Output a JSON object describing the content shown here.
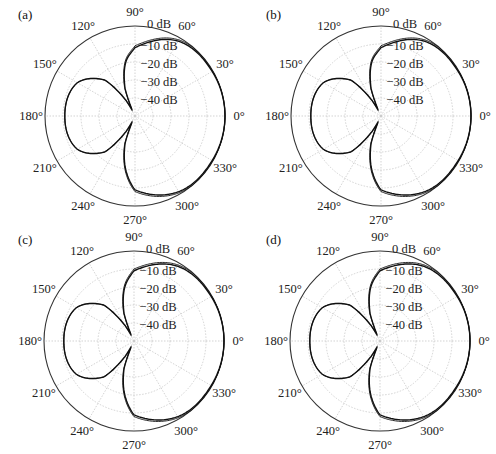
{
  "panels": [
    {
      "label": "(a)",
      "left": 0,
      "top": 0,
      "cx": 135,
      "cy": 116,
      "R": 90
    },
    {
      "label": "(b)",
      "left": 248,
      "top": 0,
      "cx": 133,
      "cy": 116,
      "R": 90
    },
    {
      "label": "(c)",
      "left": 0,
      "top": 225,
      "cx": 134,
      "cy": 116,
      "R": 90
    },
    {
      "label": "(d)",
      "left": 248,
      "top": 225,
      "cx": 132,
      "cy": 116,
      "R": 90
    }
  ],
  "chart_data": [
    {
      "type": "polar-line",
      "title": "(a)",
      "angle_ticks": [
        "0°",
        "30°",
        "60°",
        "90°",
        "120°",
        "150°",
        "180°",
        "210°",
        "240°",
        "270°",
        "300°",
        "330°"
      ],
      "radial_ticks": [
        "0 dB",
        "−10 dB",
        "−20 dB",
        "−30 dB",
        "−40 dB"
      ],
      "r_range_db": [
        -50,
        0
      ],
      "grid": true,
      "series": [
        {
          "name": "pattern",
          "theta_deg": [
            0,
            30,
            60,
            90,
            100,
            110,
            115,
            120,
            130,
            150,
            180,
            210,
            230,
            240,
            245,
            250,
            260,
            270,
            300,
            330,
            360
          ],
          "db": [
            0,
            -0.5,
            -2,
            -12,
            -20,
            -34,
            -46,
            -40,
            -24,
            -13,
            -11,
            -13,
            -24,
            -40,
            -46,
            -34,
            -20,
            -9,
            -1.5,
            -0.5,
            0
          ]
        },
        {
          "name": "reference",
          "theta_deg": [
            0,
            30,
            60,
            90,
            100,
            110,
            115,
            120,
            130,
            150,
            180,
            210,
            230,
            240,
            245,
            250,
            260,
            270,
            300,
            330,
            360
          ],
          "db": [
            0,
            -0.2,
            -1.2,
            -11,
            -19,
            -33,
            -45,
            -40,
            -24,
            -13,
            -11,
            -13,
            -24,
            -40,
            -45,
            -33,
            -19,
            -8,
            -0.8,
            -0.2,
            0
          ]
        }
      ]
    },
    {
      "type": "polar-line",
      "title": "(b)",
      "angle_ticks": [
        "0°",
        "30°",
        "60°",
        "90°",
        "120°",
        "150°",
        "180°",
        "210°",
        "240°",
        "270°",
        "300°",
        "330°"
      ],
      "radial_ticks": [
        "0 dB",
        "−10 dB",
        "−20 dB",
        "−30 dB",
        "−40 dB"
      ],
      "r_range_db": [
        -50,
        0
      ],
      "grid": true,
      "series": [
        {
          "name": "pattern",
          "theta_deg": [
            0,
            30,
            60,
            90,
            100,
            110,
            115,
            120,
            130,
            150,
            180,
            210,
            230,
            240,
            245,
            250,
            260,
            270,
            300,
            330,
            360
          ],
          "db": [
            0,
            -0.5,
            -2,
            -12,
            -20,
            -34,
            -46,
            -40,
            -24,
            -13,
            -11,
            -13,
            -24,
            -40,
            -46,
            -34,
            -20,
            -9,
            -1.5,
            -0.5,
            0
          ]
        },
        {
          "name": "reference",
          "theta_deg": [
            0,
            30,
            60,
            90,
            100,
            110,
            115,
            120,
            130,
            150,
            180,
            210,
            230,
            240,
            245,
            250,
            260,
            270,
            300,
            330,
            360
          ],
          "db": [
            0,
            -0.2,
            -1.2,
            -11,
            -19,
            -33,
            -45,
            -40,
            -24,
            -13,
            -11,
            -13,
            -24,
            -40,
            -45,
            -33,
            -19,
            -8,
            -0.8,
            -0.2,
            0
          ]
        }
      ]
    },
    {
      "type": "polar-line",
      "title": "(c)",
      "angle_ticks": [
        "0°",
        "30°",
        "60°",
        "90°",
        "120°",
        "150°",
        "180°",
        "210°",
        "240°",
        "270°",
        "300°",
        "330°"
      ],
      "radial_ticks": [
        "0 dB",
        "−10 dB",
        "−20 dB",
        "−30 dB",
        "−40 dB"
      ],
      "r_range_db": [
        -50,
        0
      ],
      "grid": true,
      "series": [
        {
          "name": "pattern",
          "theta_deg": [
            0,
            30,
            60,
            90,
            100,
            110,
            115,
            120,
            130,
            150,
            180,
            210,
            230,
            240,
            245,
            250,
            260,
            270,
            300,
            330,
            360
          ],
          "db": [
            0,
            -0.5,
            -2,
            -11,
            -20,
            -34,
            -46,
            -40,
            -24,
            -13,
            -11,
            -13,
            -24,
            -40,
            -46,
            -34,
            -20,
            -9,
            -1.5,
            -0.5,
            0
          ]
        },
        {
          "name": "reference",
          "theta_deg": [
            0,
            30,
            60,
            90,
            100,
            110,
            115,
            120,
            130,
            150,
            180,
            210,
            230,
            240,
            245,
            250,
            260,
            270,
            300,
            330,
            360
          ],
          "db": [
            0,
            -0.2,
            -1.2,
            -10,
            -19,
            -33,
            -45,
            -40,
            -24,
            -13,
            -11,
            -13,
            -24,
            -40,
            -45,
            -33,
            -19,
            -8,
            -0.8,
            -0.2,
            0
          ]
        }
      ]
    },
    {
      "type": "polar-line",
      "title": "(d)",
      "angle_ticks": [
        "0°",
        "30°",
        "60°",
        "90°",
        "120°",
        "150°",
        "180°",
        "210°",
        "240°",
        "270°",
        "300°",
        "330°"
      ],
      "radial_ticks": [
        "0 dB",
        "−10 dB",
        "−20 dB",
        "−30 dB",
        "−40 dB"
      ],
      "r_range_db": [
        -50,
        0
      ],
      "grid": true,
      "series": [
        {
          "name": "pattern",
          "theta_deg": [
            0,
            30,
            60,
            90,
            100,
            110,
            115,
            120,
            130,
            150,
            180,
            210,
            230,
            240,
            245,
            250,
            260,
            270,
            300,
            330,
            360
          ],
          "db": [
            0,
            -0.5,
            -2,
            -11,
            -20,
            -34,
            -46,
            -40,
            -24,
            -13,
            -11,
            -13,
            -24,
            -40,
            -46,
            -34,
            -20,
            -9,
            -1.5,
            -0.5,
            0
          ]
        },
        {
          "name": "reference",
          "theta_deg": [
            0,
            30,
            60,
            90,
            100,
            110,
            115,
            120,
            130,
            150,
            180,
            210,
            230,
            240,
            245,
            250,
            260,
            270,
            300,
            330,
            360
          ],
          "db": [
            0,
            -0.2,
            -1.2,
            -10,
            -19,
            -33,
            -45,
            -40,
            -24,
            -13,
            -11,
            -13,
            -24,
            -40,
            -45,
            -33,
            -19,
            -8,
            -0.8,
            -0.2,
            0
          ]
        }
      ]
    }
  ],
  "colors": {
    "curve": "#111111",
    "outer": "#333333",
    "grid": "#c8c8c8",
    "text": "#222222"
  }
}
